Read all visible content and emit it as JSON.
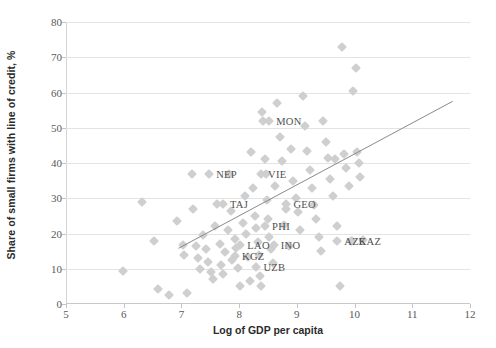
{
  "chart_data": {
    "type": "scatter",
    "title": "",
    "xlabel": "Log of GDP per capita",
    "ylabel": "Share of small firms with line of credit, %",
    "xlim": [
      5,
      12
    ],
    "ylim": [
      0,
      80
    ],
    "xticks": [
      5,
      6,
      7,
      8,
      9,
      10,
      11,
      12
    ],
    "yticks": [
      0,
      10,
      20,
      30,
      40,
      50,
      60,
      70,
      80
    ],
    "grid": true,
    "legend": "none",
    "marker_color": "#cfcfcf",
    "marker_shape": "diamond",
    "trendline": {
      "color": "#8a8a8a",
      "x_start": 6.95,
      "y_start": 15.8,
      "x_end": 11.7,
      "y_end": 57.5
    },
    "annotations": [
      {
        "label": "MON",
        "x": 8.52,
        "y": 52.0
      },
      {
        "label": "NEP",
        "x": 7.48,
        "y": 36.8
      },
      {
        "label": "VIE",
        "x": 8.38,
        "y": 36.8
      },
      {
        "label": "TAJ",
        "x": 7.72,
        "y": 28.5
      },
      {
        "label": "GEO",
        "x": 8.82,
        "y": 28.5
      },
      {
        "label": "PHI",
        "x": 8.45,
        "y": 22.2
      },
      {
        "label": "LAO",
        "x": 8.02,
        "y": 16.6
      },
      {
        "label": "INO",
        "x": 8.6,
        "y": 16.6
      },
      {
        "label": "AZE",
        "x": 9.7,
        "y": 18.0
      },
      {
        "label": "KAZ",
        "x": 9.95,
        "y": 18.0
      },
      {
        "label": "KGZ",
        "x": 7.93,
        "y": 13.5
      },
      {
        "label": "UZB",
        "x": 8.3,
        "y": 10.5
      }
    ],
    "points": [
      {
        "x": 5.98,
        "y": 9.5
      },
      {
        "x": 6.32,
        "y": 29.0
      },
      {
        "x": 6.52,
        "y": 18.0
      },
      {
        "x": 6.6,
        "y": 4.2
      },
      {
        "x": 6.78,
        "y": 2.5
      },
      {
        "x": 6.92,
        "y": 23.5
      },
      {
        "x": 7.02,
        "y": 16.8
      },
      {
        "x": 7.05,
        "y": 14.0
      },
      {
        "x": 7.1,
        "y": 3.0
      },
      {
        "x": 7.18,
        "y": 36.8
      },
      {
        "x": 7.2,
        "y": 27.0
      },
      {
        "x": 7.25,
        "y": 16.5
      },
      {
        "x": 7.28,
        "y": 13.0
      },
      {
        "x": 7.32,
        "y": 10.0
      },
      {
        "x": 7.38,
        "y": 19.5
      },
      {
        "x": 7.42,
        "y": 15.5
      },
      {
        "x": 7.46,
        "y": 12.0
      },
      {
        "x": 7.52,
        "y": 9.0
      },
      {
        "x": 7.55,
        "y": 7.0
      },
      {
        "x": 7.58,
        "y": 22.0
      },
      {
        "x": 7.62,
        "y": 28.5
      },
      {
        "x": 7.66,
        "y": 17.0
      },
      {
        "x": 7.68,
        "y": 11.0
      },
      {
        "x": 7.72,
        "y": 8.5
      },
      {
        "x": 7.76,
        "y": 14.8
      },
      {
        "x": 7.8,
        "y": 21.0
      },
      {
        "x": 7.82,
        "y": 36.8
      },
      {
        "x": 7.86,
        "y": 26.5
      },
      {
        "x": 7.88,
        "y": 12.5
      },
      {
        "x": 7.92,
        "y": 18.5
      },
      {
        "x": 7.95,
        "y": 16.0
      },
      {
        "x": 7.98,
        "y": 10.2
      },
      {
        "x": 8.02,
        "y": 5.0
      },
      {
        "x": 8.06,
        "y": 23.0
      },
      {
        "x": 8.1,
        "y": 30.5
      },
      {
        "x": 8.12,
        "y": 19.8
      },
      {
        "x": 8.15,
        "y": 13.2
      },
      {
        "x": 8.18,
        "y": 6.5
      },
      {
        "x": 8.2,
        "y": 43.0
      },
      {
        "x": 8.24,
        "y": 33.0
      },
      {
        "x": 8.28,
        "y": 25.0
      },
      {
        "x": 8.3,
        "y": 21.5
      },
      {
        "x": 8.32,
        "y": 17.5
      },
      {
        "x": 8.34,
        "y": 14.0
      },
      {
        "x": 8.36,
        "y": 8.0
      },
      {
        "x": 8.38,
        "y": 5.2
      },
      {
        "x": 8.4,
        "y": 54.5
      },
      {
        "x": 8.42,
        "y": 52.0
      },
      {
        "x": 8.44,
        "y": 41.0
      },
      {
        "x": 8.46,
        "y": 36.8
      },
      {
        "x": 8.48,
        "y": 29.5
      },
      {
        "x": 8.5,
        "y": 24.0
      },
      {
        "x": 8.52,
        "y": 19.0
      },
      {
        "x": 8.56,
        "y": 15.5
      },
      {
        "x": 8.58,
        "y": 11.5
      },
      {
        "x": 8.62,
        "y": 33.5
      },
      {
        "x": 8.66,
        "y": 57.0
      },
      {
        "x": 8.7,
        "y": 47.5
      },
      {
        "x": 8.74,
        "y": 40.5
      },
      {
        "x": 8.78,
        "y": 22.5
      },
      {
        "x": 8.82,
        "y": 27.0
      },
      {
        "x": 8.86,
        "y": 16.5
      },
      {
        "x": 8.9,
        "y": 44.0
      },
      {
        "x": 8.94,
        "y": 35.0
      },
      {
        "x": 8.98,
        "y": 30.0
      },
      {
        "x": 9.02,
        "y": 26.0
      },
      {
        "x": 9.06,
        "y": 21.0
      },
      {
        "x": 9.1,
        "y": 59.0
      },
      {
        "x": 9.14,
        "y": 50.5
      },
      {
        "x": 9.18,
        "y": 43.5
      },
      {
        "x": 9.22,
        "y": 38.0
      },
      {
        "x": 9.26,
        "y": 33.0
      },
      {
        "x": 9.3,
        "y": 28.0
      },
      {
        "x": 9.34,
        "y": 24.0
      },
      {
        "x": 9.38,
        "y": 19.0
      },
      {
        "x": 9.42,
        "y": 15.0
      },
      {
        "x": 9.46,
        "y": 52.0
      },
      {
        "x": 9.5,
        "y": 46.0
      },
      {
        "x": 9.54,
        "y": 41.5
      },
      {
        "x": 9.58,
        "y": 35.5
      },
      {
        "x": 9.62,
        "y": 30.5
      },
      {
        "x": 9.66,
        "y": 41.0
      },
      {
        "x": 9.7,
        "y": 22.0
      },
      {
        "x": 9.74,
        "y": 5.2
      },
      {
        "x": 9.78,
        "y": 73.0
      },
      {
        "x": 9.82,
        "y": 42.5
      },
      {
        "x": 9.86,
        "y": 38.5
      },
      {
        "x": 9.9,
        "y": 33.5
      },
      {
        "x": 9.94,
        "y": 18.0
      },
      {
        "x": 9.98,
        "y": 60.5
      },
      {
        "x": 10.02,
        "y": 67.0
      },
      {
        "x": 10.04,
        "y": 43.0
      },
      {
        "x": 10.08,
        "y": 40.0
      },
      {
        "x": 10.1,
        "y": 36.0
      },
      {
        "x": 10.14,
        "y": 18.2
      }
    ]
  },
  "caption": {
    "text": ""
  }
}
